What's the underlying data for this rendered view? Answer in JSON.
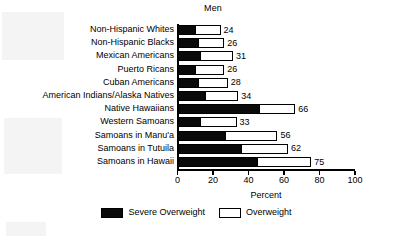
{
  "chart_data": {
    "type": "bar",
    "orientation": "horizontal",
    "stacked": true,
    "title": "Men",
    "xlabel": "Percent",
    "ylabel": "",
    "xlim": [
      0,
      100
    ],
    "xticks": [
      0,
      20,
      40,
      60,
      80,
      100
    ],
    "xtick_labels": [
      "0",
      "20",
      "40",
      "60",
      "80",
      "100"
    ],
    "grid": false,
    "legend_position": "bottom-center",
    "categories": [
      "Non-Hispanic Whites",
      "Non-Hispanic Blacks",
      "Mexican Americans",
      "Puerto Ricans",
      "Cuban Americans",
      "American Indians/Alaska Natives",
      "Native Hawaiians",
      "Western Samoans",
      "Samoans in Manu'a",
      "Samoans in Tutuila",
      "Samoans in Hawaii"
    ],
    "series": [
      {
        "name": "Severe Overweight",
        "color": "#0a0a0a",
        "values": [
          10,
          12,
          13,
          10,
          12,
          16,
          46,
          13,
          27,
          36,
          45
        ]
      },
      {
        "name": "Overweight",
        "color": "#ffffff",
        "values": [
          14,
          14,
          18,
          16,
          16,
          18,
          20,
          20,
          29,
          26,
          30
        ]
      }
    ],
    "totals": [
      24,
      26,
      31,
      26,
      28,
      34,
      66,
      33,
      56,
      62,
      75
    ],
    "data_labels": [
      "24",
      "26",
      "31",
      "26",
      "28",
      "34",
      "66",
      "33",
      "56",
      "62",
      "75"
    ],
    "legend": [
      {
        "label": "Severe Overweight",
        "swatch": "filled"
      },
      {
        "label": "Overweight",
        "swatch": "hollow"
      }
    ]
  }
}
